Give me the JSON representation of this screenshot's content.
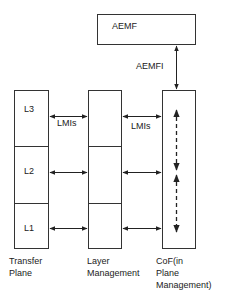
{
  "diagram": {
    "top_box": {
      "label": "AEMF"
    },
    "top_link": {
      "label": "AEMFI"
    },
    "columns": [
      {
        "id": "transfer-plane",
        "caption_lines": [
          "Transfer",
          "Plane"
        ],
        "cells": [
          "L3",
          "L2",
          "L1"
        ]
      },
      {
        "id": "layer-management",
        "caption_lines": [
          "Layer",
          "Management"
        ],
        "cells": [
          "",
          "",
          ""
        ]
      },
      {
        "id": "cof",
        "caption_lines": [
          "CoF(in",
          "Plane",
          "Management)"
        ]
      }
    ],
    "links": [
      {
        "from": "transfer-plane.L3",
        "to": "layer-management.row1",
        "label": "LMIs"
      },
      {
        "from": "layer-management.row1",
        "to": "cof",
        "label": "LMIs"
      },
      {
        "from": "transfer-plane.L2",
        "to": "layer-management.row2",
        "label": ""
      },
      {
        "from": "layer-management.row2",
        "to": "cof",
        "label": ""
      },
      {
        "from": "transfer-plane.L1",
        "to": "layer-management.row3",
        "label": ""
      },
      {
        "from": "layer-management.row3",
        "to": "cof",
        "label": ""
      }
    ],
    "colors": {
      "line": "#333333",
      "background": "#ffffff"
    }
  }
}
